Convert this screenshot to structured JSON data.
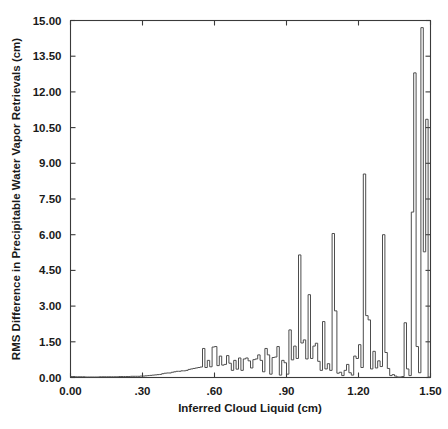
{
  "chart_data": {
    "type": "line",
    "subtype": "step-histogram",
    "title": "",
    "xlabel": "Inferred Cloud Liquid (cm)",
    "ylabel": "RMS Difference in Precipitable Water Vapor Retrievals (cm)",
    "xlim": [
      0.0,
      1.5
    ],
    "ylim": [
      0.0,
      15.0
    ],
    "xticks": [
      0.0,
      0.3,
      0.6,
      0.9,
      1.2,
      1.5
    ],
    "xtick_labels": [
      "0.00",
      ".30",
      ".60",
      ".90",
      "1.20",
      "1.50"
    ],
    "yticks": [
      0.0,
      1.5,
      3.0,
      4.5,
      6.0,
      7.5,
      9.0,
      10.5,
      12.0,
      13.5,
      15.0
    ],
    "ytick_labels": [
      "0.00",
      "1.50",
      "3.00",
      "4.50",
      "6.00",
      "7.50",
      "9.00",
      "10.50",
      "12.00",
      "13.50",
      "15.00"
    ],
    "grid": false,
    "legend": null,
    "line_color": "#4d4d4d",
    "frame_color": "#3a3a3a",
    "bin_width": 0.01,
    "x": [
      0.0,
      0.01,
      0.02,
      0.03,
      0.04,
      0.05,
      0.06,
      0.07,
      0.08,
      0.09,
      0.1,
      0.11,
      0.12,
      0.13,
      0.14,
      0.15,
      0.16,
      0.17,
      0.18,
      0.19,
      0.2,
      0.21,
      0.22,
      0.23,
      0.24,
      0.25,
      0.26,
      0.27,
      0.28,
      0.29,
      0.3,
      0.31,
      0.32,
      0.33,
      0.34,
      0.35,
      0.36,
      0.37,
      0.38,
      0.39,
      0.4,
      0.41,
      0.42,
      0.43,
      0.44,
      0.45,
      0.46,
      0.47,
      0.48,
      0.49,
      0.5,
      0.51,
      0.52,
      0.53,
      0.54,
      0.55,
      0.56,
      0.57,
      0.58,
      0.59,
      0.6,
      0.61,
      0.62,
      0.63,
      0.64,
      0.65,
      0.66,
      0.67,
      0.68,
      0.69,
      0.7,
      0.71,
      0.72,
      0.73,
      0.74,
      0.75,
      0.76,
      0.77,
      0.78,
      0.79,
      0.8,
      0.81,
      0.82,
      0.83,
      0.84,
      0.85,
      0.86,
      0.87,
      0.88,
      0.89,
      0.9,
      0.91,
      0.92,
      0.93,
      0.94,
      0.95,
      0.96,
      0.97,
      0.98,
      0.99,
      1.0,
      1.01,
      1.02,
      1.03,
      1.04,
      1.05,
      1.06,
      1.07,
      1.08,
      1.09,
      1.1,
      1.11,
      1.12,
      1.13,
      1.14,
      1.15,
      1.16,
      1.17,
      1.18,
      1.19,
      1.2,
      1.21,
      1.22,
      1.23,
      1.24,
      1.25,
      1.26,
      1.27,
      1.28,
      1.29,
      1.3,
      1.31,
      1.32,
      1.33,
      1.34,
      1.35,
      1.36,
      1.37,
      1.38,
      1.39,
      1.4,
      1.41,
      1.42,
      1.43,
      1.44,
      1.45,
      1.46,
      1.47,
      1.48,
      1.49
    ],
    "y": [
      0.04,
      0.04,
      0.03,
      0.03,
      0.03,
      0.03,
      0.02,
      0.02,
      0.02,
      0.02,
      0.02,
      0.02,
      0.03,
      0.03,
      0.03,
      0.03,
      0.03,
      0.03,
      0.03,
      0.03,
      0.04,
      0.04,
      0.04,
      0.04,
      0.04,
      0.05,
      0.05,
      0.05,
      0.05,
      0.06,
      0.06,
      0.07,
      0.08,
      0.09,
      0.1,
      0.11,
      0.12,
      0.13,
      0.16,
      0.18,
      0.19,
      0.19,
      0.22,
      0.24,
      0.26,
      0.26,
      0.28,
      0.28,
      0.3,
      0.34,
      0.36,
      0.38,
      0.4,
      0.42,
      0.44,
      1.22,
      0.42,
      0.72,
      0.45,
      1.28,
      1.3,
      0.5,
      0.9,
      0.52,
      0.55,
      0.92,
      0.6,
      0.3,
      0.72,
      0.35,
      0.82,
      0.3,
      0.78,
      0.82,
      0.7,
      0.4,
      0.75,
      0.78,
      0.95,
      0.72,
      0.24,
      1.22,
      0.95,
      0.14,
      0.84,
      0.86,
      1.3,
      0.1,
      0.72,
      0.62,
      0.14,
      2.0,
      0.74,
      1.32,
      0.8,
      5.15,
      1.45,
      1.58,
      0.78,
      3.48,
      0.8,
      1.32,
      1.44,
      0.68,
      0.3,
      2.35,
      0.36,
      0.58,
      0.3,
      6.05,
      2.8,
      0.18,
      0.22,
      0.08,
      0.3,
      0.55,
      0.2,
      0.1,
      0.9,
      0.8,
      1.38,
      0.42,
      8.55,
      2.6,
      2.42,
      0.36,
      1.1,
      0.4,
      0.7,
      0.46,
      6.0,
      1.05,
      0.38,
      0.08,
      0.12,
      0.06,
      0.02,
      0.02,
      0.04,
      2.3,
      0.36,
      0.08,
      6.95,
      12.8,
      1.3,
      0.2,
      14.7,
      5.28,
      10.85,
      0.02
    ]
  },
  "axes": {
    "x_title": "Inferred Cloud Liquid (cm)",
    "y_title": "RMS Difference in Precipitable Water Vapor Retrievals (cm)"
  }
}
